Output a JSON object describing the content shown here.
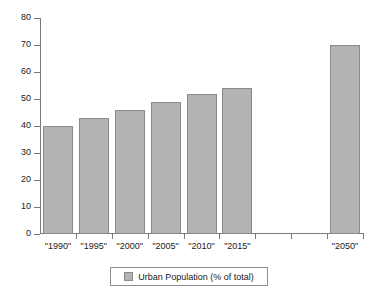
{
  "chart_data": {
    "type": "bar",
    "title": "",
    "xlabel": "",
    "ylabel": "",
    "ylim": [
      0,
      80
    ],
    "ytick_values": [
      0,
      10,
      20,
      30,
      40,
      50,
      60,
      70,
      80
    ],
    "ytick_labels": [
      "0",
      "10",
      "20",
      "30",
      "40",
      "50",
      "60",
      "70",
      "80"
    ],
    "grid": false,
    "legend_position": "bottom",
    "categories": [
      "\"1990\"",
      "\"1995\"",
      "\"2000\"",
      "\"2005\"",
      "\"2010\"",
      "\"2015\"",
      "",
      "",
      "\"2050\""
    ],
    "series": [
      {
        "name": "Urban Population (% of total)",
        "color": "#b3b3b3",
        "values": [
          40,
          43,
          46,
          49,
          52,
          54,
          null,
          null,
          70
        ]
      }
    ]
  },
  "legend": {
    "entries": [
      {
        "label": "Urban Population (% of total)",
        "swatch_color": "#b3b3b3"
      }
    ]
  },
  "axis": {
    "line_color": "#7a7a7a"
  }
}
